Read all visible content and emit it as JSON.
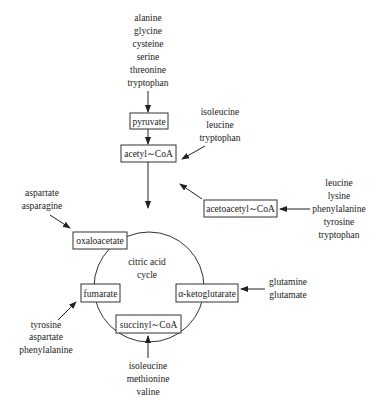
{
  "diagram": {
    "center_label": [
      "citric acid",
      "cycle"
    ],
    "nodes": {
      "pyruvate": "pyruvate",
      "acetyl_coa": "acetyl∼CoA",
      "acetoacetyl_coa": "acetoacetyl∼CoA",
      "oxaloacetate": "oxaloacetate",
      "fumarate": "fumarate",
      "alpha_ketoglutarate": "α-ketoglutarate",
      "succinyl_coa": "succinyl∼CoA"
    },
    "inputs": {
      "to_pyruvate": [
        "alanine",
        "glycine",
        "cysteine",
        "serine",
        "threonine",
        "tryptophan"
      ],
      "to_acetyl_coa": [
        "isoleucine",
        "leucine",
        "tryptophan"
      ],
      "to_acetoacetyl_coa": [
        "leucine",
        "lysine",
        "phenylalanine",
        "tyrosine",
        "tryptophan"
      ],
      "to_oxaloacetate": [
        "aspartate",
        "asparagine"
      ],
      "to_alpha_ketoglutarate": [
        "glutamine",
        "glutamate"
      ],
      "to_fumarate": [
        "tyrosine",
        "aspartate",
        "phenylalanine"
      ],
      "to_succinyl_coa": [
        "isoleucine",
        "methionine",
        "valine"
      ]
    }
  }
}
